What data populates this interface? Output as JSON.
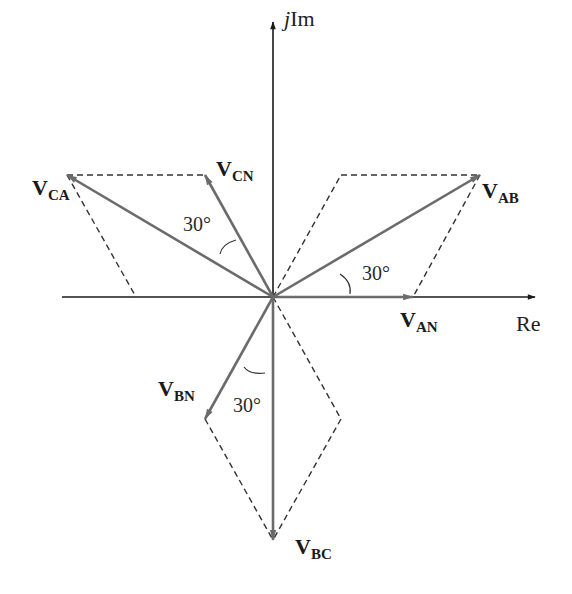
{
  "axes": {
    "imag_label_j": "j",
    "imag_label": "Im",
    "real_label": "Re"
  },
  "phasors": {
    "van": {
      "main": "V",
      "sub": "AN"
    },
    "vab": {
      "main": "V",
      "sub": "AB"
    },
    "vca": {
      "main": "V",
      "sub": "CA"
    },
    "vcn": {
      "main": "V",
      "sub": "CN"
    },
    "vbn": {
      "main": "V",
      "sub": "BN"
    },
    "vbc": {
      "main": "V",
      "sub": "BC"
    }
  },
  "angles": {
    "ab_an": "30°",
    "ca_cn": "30°",
    "bn_bc": "30°"
  },
  "colors": {
    "phasor": "#6b6b6b",
    "axis": "#1a1a1a",
    "dashed": "#333333"
  }
}
